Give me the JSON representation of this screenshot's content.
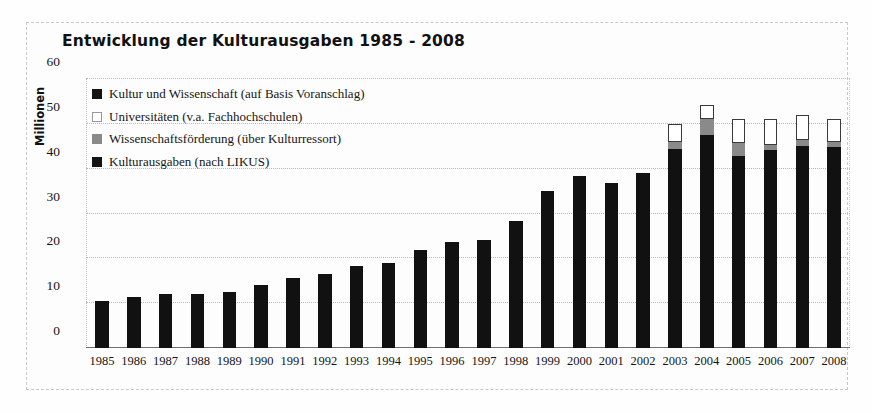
{
  "chart_data": {
    "type": "bar",
    "title": "Entwicklung der Kulturausgaben 1985 - 2008",
    "xlabel": "",
    "ylabel": "Millionen",
    "ylim": [
      0,
      60
    ],
    "yticks": [
      0,
      10,
      20,
      30,
      40,
      50,
      60
    ],
    "grid": true,
    "stacked": true,
    "legend_position": "top-left inside plot",
    "categories": [
      "1985",
      "1986",
      "1987",
      "1988",
      "1989",
      "1990",
      "1991",
      "1992",
      "1993",
      "1994",
      "1995",
      "1996",
      "1997",
      "1998",
      "1999",
      "2000",
      "2001",
      "2002",
      "2003",
      "2004",
      "2005",
      "2006",
      "2007",
      "2008"
    ],
    "series": [
      {
        "name": "Kulturausgaben (nach LIKUS)",
        "color": "#111111",
        "values": [
          10.5,
          11.4,
          12.1,
          12.0,
          12.6,
          14.1,
          15.6,
          16.5,
          18.2,
          18.9,
          21.8,
          23.6,
          24.2,
          28.4,
          35.0,
          38.3,
          36.7,
          39.0,
          44.3,
          47.5,
          42.8,
          44.1,
          45.1,
          44.8
        ]
      },
      {
        "name": "Wissenschaftsförderung (über Kulturressort)",
        "color": "#8a8a8a",
        "values": [
          0,
          0,
          0,
          0,
          0,
          0,
          0,
          0,
          0,
          0,
          0,
          0,
          0,
          0,
          0,
          0,
          0,
          0,
          1.6,
          3.6,
          2.9,
          1.1,
          1.2,
          1.1
        ]
      },
      {
        "name": "Universitäten (v.a. Fachhochschulen)",
        "color": "#ffffff",
        "values": [
          0,
          0,
          0,
          0,
          0,
          0,
          0,
          0,
          0,
          0,
          0,
          0,
          0,
          0,
          0,
          0,
          0,
          0,
          4.1,
          3.0,
          5.3,
          5.8,
          5.7,
          5.1
        ]
      },
      {
        "name": "Kultur und Wissenschaft (auf Basis Voranschlag)",
        "color": "#141414",
        "values": [
          0,
          0,
          0,
          0,
          0,
          0,
          0,
          0,
          0,
          0,
          0,
          0,
          0,
          0,
          0,
          0,
          0,
          0,
          0,
          0,
          0,
          0,
          0,
          0
        ]
      }
    ],
    "totals": [
      10.5,
      11.4,
      12.1,
      12.0,
      12.6,
      14.1,
      15.6,
      16.5,
      18.2,
      18.9,
      21.8,
      23.6,
      24.2,
      28.4,
      35.0,
      38.3,
      36.7,
      39.0,
      50.0,
      54.1,
      51.0,
      51.0,
      52.0,
      51.0
    ]
  },
  "legend": {
    "items": [
      {
        "swatch": "dark",
        "label": "Kultur und Wissenschaft (auf Basis Voranschlag)"
      },
      {
        "swatch": "white",
        "label": "Universitäten (v.a. Fachhochschulen)"
      },
      {
        "swatch": "gray",
        "label": "Wissenschaftsförderung (über Kulturressort)"
      },
      {
        "swatch": "dark",
        "label": "Kulturausgaben (nach LIKUS)"
      }
    ]
  },
  "colors": {
    "likus": "#111111",
    "wissenschaft": "#8a8a8a",
    "universitaeten": "#ffffff",
    "grid": "#b9b9b9",
    "axis": "#6f6f6f",
    "background": "#fdfdfd"
  }
}
